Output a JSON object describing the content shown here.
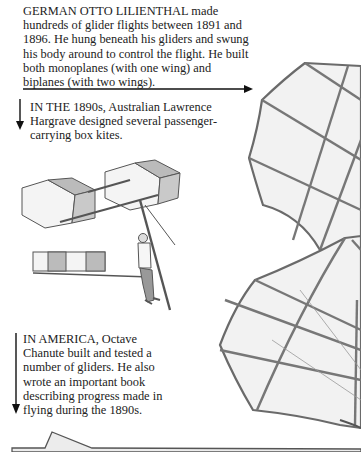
{
  "page": {
    "captions": [
      {
        "id": "lilienthal",
        "lead": "GERMAN OTTO LILIENTHAL",
        "text": "made hundreds of glider flights between 1891 and 1896. He hung beneath his gliders and swung his body around to control the flight. He built both monoplanes (with one wing) and biplanes (with two wings).",
        "arrow_direction": "right"
      },
      {
        "id": "hargrave",
        "lead": "IN THE 1890s,",
        "text": "Australian Lawrence Hargrave designed several passenger-carrying box kites.",
        "arrow_direction": "down"
      },
      {
        "id": "chanute",
        "lead": "IN AMERICA,",
        "text": "Octave Chanute built and tested a number of gliders. He also wrote an important book describing progress made in flying during the 1890s.",
        "arrow_direction": "down"
      }
    ],
    "illustrations": [
      {
        "name": "hargrave-box-kite-glider",
        "description": "Man hanging from a box-kite glider"
      },
      {
        "name": "lilienthal-glider-wings",
        "description": "Large bat-like ribbed glider wings, upper and lower"
      },
      {
        "name": "chanute-glider-edge",
        "description": "Edge of a glider wing at page bottom"
      }
    ],
    "colors": {
      "text": "#222222",
      "frame": "#6e6e6e",
      "fabric": "#f1f1f1",
      "background": "#ffffff"
    }
  }
}
